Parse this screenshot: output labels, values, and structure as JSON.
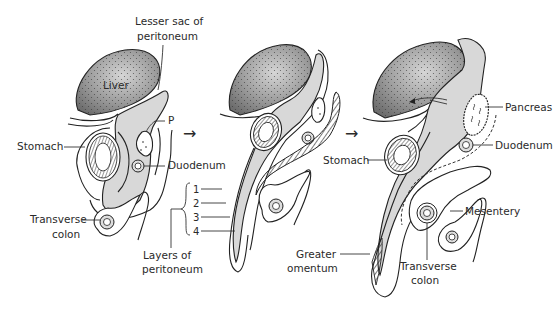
{
  "diagram": {
    "stages": [
      {
        "id": "stage-1",
        "labels": {
          "lesser_sac": [
            "Lesser sac of",
            "peritoneum"
          ],
          "liver": "Liver",
          "p": "P",
          "stomach": "Stomach",
          "duodenum": "Duodenum",
          "transverse_colon": [
            "Transverse",
            "colon"
          ]
        }
      },
      {
        "id": "stage-2",
        "labels": {
          "layers": [
            "1",
            "2",
            "3",
            "4"
          ],
          "layers_caption": [
            "Layers of",
            "peritoneum"
          ]
        }
      },
      {
        "id": "stage-3",
        "labels": {
          "pancreas": "Pancreas",
          "stomach": "Stomach",
          "duodenum": "Duodenum",
          "mesentery": "Mesentery",
          "greater_omentum": [
            "Greater",
            "omentum"
          ],
          "transverse_colon": [
            "Transverse",
            "colon"
          ]
        }
      }
    ],
    "arrows": [
      "→",
      "→"
    ],
    "colors": {
      "outline": "#222222",
      "cavity_fill": "#d8d8d8",
      "liver_fill": "#8a8a8a",
      "liver_highlight": "#d0d0d0",
      "background": "#ffffff"
    }
  }
}
